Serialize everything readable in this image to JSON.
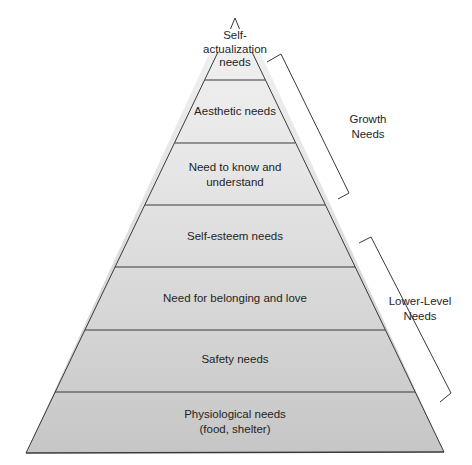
{
  "diagram": {
    "type": "pyramid",
    "levels": [
      {
        "label_line1": "Self-",
        "label_line2": "actualization",
        "label_line3": "needs"
      },
      {
        "label": "Aesthetic needs"
      },
      {
        "label_line1": "Need to know and",
        "label_line2": "understand"
      },
      {
        "label": "Self-esteem needs"
      },
      {
        "label": "Need for belonging and love"
      },
      {
        "label": "Safety needs"
      },
      {
        "label_line1": "Physiological needs",
        "label_line2": "(food, shelter)"
      }
    ],
    "groups": {
      "growth": {
        "line1": "Growth",
        "line2": "Needs"
      },
      "lower": {
        "line1": "Lower-Level",
        "line2": "Needs"
      }
    },
    "colors": {
      "top_fill": "#efefef",
      "bottom_fill": "#c8c8c8",
      "stroke": "#3a3a3a"
    }
  }
}
